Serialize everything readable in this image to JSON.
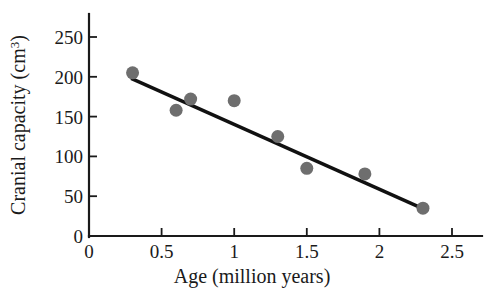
{
  "chart_data": {
    "type": "scatter",
    "title": "",
    "xlabel": "Age (million years)",
    "ylabel": "Cranial capacity (cm³)",
    "ylabel_base": "Cranial capacity (cm",
    "ylabel_sup": "3",
    "ylabel_close": ")",
    "xlim": [
      0,
      2.5
    ],
    "ylim": [
      0,
      265
    ],
    "grid": false,
    "legend": null,
    "x": [
      0.3,
      0.6,
      0.7,
      1.0,
      1.3,
      1.5,
      1.9,
      2.3
    ],
    "y": [
      205,
      158,
      172,
      170,
      125,
      85,
      78,
      35
    ],
    "points": [
      {
        "x": 0.3,
        "y": 205
      },
      {
        "x": 0.6,
        "y": 158
      },
      {
        "x": 0.7,
        "y": 172
      },
      {
        "x": 1.0,
        "y": 170
      },
      {
        "x": 1.3,
        "y": 125
      },
      {
        "x": 1.5,
        "y": 85
      },
      {
        "x": 1.9,
        "y": 78
      },
      {
        "x": 2.3,
        "y": 35
      }
    ],
    "point_color": "#6e6e6e",
    "point_radius": 6.5,
    "trend_line": {
      "type": "line",
      "x": [
        0.29,
        2.28
      ],
      "y": [
        198,
        36
      ],
      "color": "#111111"
    },
    "xticks": [
      0,
      0.5,
      1,
      1.5,
      2,
      2.5
    ],
    "xtick_labels": [
      "0",
      "0.5",
      "1",
      "1.5",
      "2",
      "2.5"
    ],
    "yticks": [
      0,
      50,
      100,
      150,
      200,
      250
    ],
    "ytick_labels": [
      "0",
      "50",
      "100",
      "150",
      "200",
      "250"
    ]
  }
}
